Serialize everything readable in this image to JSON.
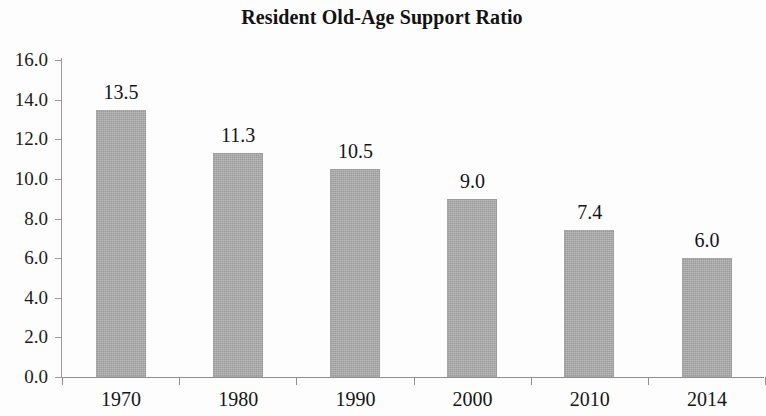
{
  "chart_data": {
    "type": "bar",
    "title": "Resident Old-Age Support Ratio",
    "xlabel": "",
    "ylabel": "",
    "categories": [
      "1970",
      "1980",
      "1990",
      "2000",
      "2010",
      "2014"
    ],
    "values": [
      13.5,
      11.3,
      10.5,
      9.0,
      7.4,
      6.0
    ],
    "data_labels": [
      "13.5",
      "11.3",
      "10.5",
      "9.0",
      "7.4",
      "6.0"
    ],
    "ylim": [
      0.0,
      16.0
    ],
    "ytick_step": 2.0,
    "ytick_labels": [
      "16.0",
      "14.0",
      "12.0",
      "10.0",
      "8.0",
      "6.0",
      "4.0",
      "2.0",
      "0.0"
    ],
    "ytick_values": [
      16.0,
      14.0,
      12.0,
      10.0,
      8.0,
      6.0,
      4.0,
      2.0,
      0.0
    ],
    "grid": false,
    "legend": false,
    "legend_position": "none",
    "bar_color": "#a9a9a9",
    "axis_color": "#8f8f8f",
    "text_color": "#141414",
    "background_color": "#ffffff"
  }
}
